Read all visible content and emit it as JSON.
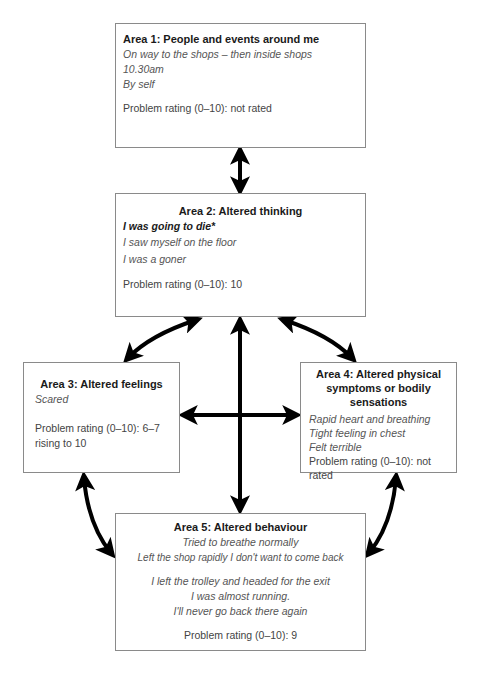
{
  "diagram": {
    "type": "five-areas-cbt-model",
    "areas": [
      {
        "title": "Area 1: People and events around me",
        "lines": [
          "On way to the shops – then inside shops",
          "10.30am",
          "By self"
        ],
        "rating": "Problem rating (0–10): not rated"
      },
      {
        "title": "Area 2: Altered thinking",
        "emphasis": "I was going to die*",
        "lines": [
          "I saw myself on the floor",
          "I was a goner"
        ],
        "rating": "Problem rating (0–10): 10"
      },
      {
        "title": "Area 3: Altered feelings",
        "lines": [
          "Scared"
        ],
        "rating": "Problem rating (0–10): 6–7",
        "rating_cont": "rising to 10"
      },
      {
        "title_lines": [
          "Area 4: Altered physical",
          "symptoms or bodily",
          "sensations"
        ],
        "lines": [
          "Rapid heart and breathing",
          "Tight feeling in chest",
          "Felt terrible"
        ],
        "rating": "Problem rating (0–10): not rated"
      },
      {
        "title": "Area 5: Altered behaviour",
        "lines": [
          "Tried to breathe normally",
          "Left the shop rapidly I don't want to come back"
        ],
        "lines2": [
          "I left the trolley and headed for the exit",
          "I was almost running.",
          "I'll never go back there again"
        ],
        "rating": "Problem rating (0–10): 9"
      }
    ],
    "connections": [
      {
        "from": "Area 1",
        "to": "Area 2",
        "type": "bidirectional"
      },
      {
        "from": "Area 2",
        "to": "Area 3",
        "type": "bidirectional"
      },
      {
        "from": "Area 2",
        "to": "Area 4",
        "type": "bidirectional"
      },
      {
        "from": "Area 2",
        "to": "Area 5",
        "type": "bidirectional"
      },
      {
        "from": "Area 3",
        "to": "Area 4",
        "type": "bidirectional"
      },
      {
        "from": "Area 3",
        "to": "Area 5",
        "type": "bidirectional"
      },
      {
        "from": "Area 4",
        "to": "Area 5",
        "type": "bidirectional"
      }
    ],
    "colors": {
      "border": "#8a8a8a",
      "arrow": "#000000",
      "title": "#1a1a1a",
      "italic_text": "#555555"
    }
  }
}
